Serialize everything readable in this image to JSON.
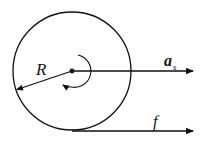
{
  "diagram": {
    "colors": {
      "stroke": "#111111",
      "background": "#ffffff"
    },
    "wheel": {
      "cx": 72,
      "cy": 71,
      "r": 59
    },
    "labels": {
      "radius": "R",
      "acceleration_main": "a",
      "acceleration_sub": "s",
      "friction": "f"
    },
    "arrows": [
      {
        "name": "radius-arrow",
        "from": [
          72,
          71
        ],
        "to": [
          16,
          90
        ],
        "label": "R"
      },
      {
        "name": "acceleration-arrow",
        "from": [
          72,
          71
        ],
        "to": [
          193,
          71
        ],
        "label": "a_s"
      },
      {
        "name": "friction-arrow",
        "from": [
          72,
          131
        ],
        "to": [
          193,
          131
        ],
        "label": "f"
      },
      {
        "name": "rotation-arc",
        "direction": "counterclockwise"
      }
    ]
  }
}
